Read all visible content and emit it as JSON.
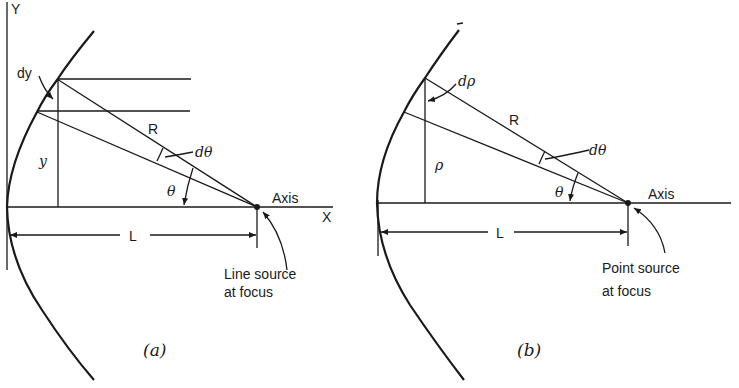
{
  "figure": {
    "panels": [
      {
        "id": "a",
        "caption": "(a)",
        "axis_labels": {
          "y": "Y",
          "x": "X"
        },
        "labels": {
          "dy": "dy",
          "R": "R",
          "dtheta": "dθ",
          "theta": "θ",
          "y": "y",
          "axis": "Axis",
          "L": "L",
          "source_line1": "Line source",
          "source_line2": "at focus"
        }
      },
      {
        "id": "b",
        "caption": "(b)",
        "labels": {
          "drho": "dρ",
          "R": "R",
          "dtheta": "dθ",
          "theta": "θ",
          "rho": "ρ",
          "axis": "Axis",
          "L": "L",
          "source_line1": "Point source",
          "source_line2": "at focus"
        }
      }
    ],
    "colors": {
      "ink": "#1a1a1a",
      "paper": "#ffffff"
    }
  }
}
